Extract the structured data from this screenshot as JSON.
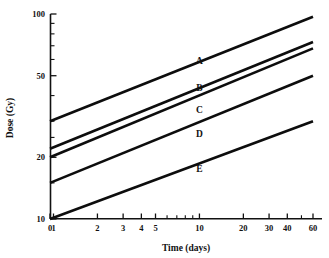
{
  "chart_data": {
    "type": "line",
    "title": "",
    "xlabel": "Time  (days)",
    "ylabel": "Dose  (Gy)",
    "xscale": "log",
    "yscale": "log",
    "xlim": [
      0,
      65
    ],
    "ylim": [
      10,
      100
    ],
    "grid": false,
    "legend_position": "inline-right",
    "x_tick_labels": [
      "0",
      "1",
      "2",
      "3",
      "4",
      "5",
      "10",
      "20",
      "30",
      "40",
      "60"
    ],
    "x_tick_values": [
      0,
      1,
      2,
      3,
      4,
      5,
      10,
      20,
      30,
      40,
      60
    ],
    "x_minor_ticks": [
      6,
      7,
      8,
      9,
      50
    ],
    "y_tick_labels": [
      "10",
      "20",
      "50",
      "100"
    ],
    "y_tick_values": [
      10,
      20,
      50,
      100
    ],
    "y_minor_ticks": [
      15,
      25,
      30,
      40,
      60,
      70,
      80,
      90
    ],
    "series": [
      {
        "name": "A",
        "label": "A",
        "x": [
          0,
          60
        ],
        "values": [
          30,
          97
        ],
        "label_x": 10,
        "label_y": 57
      },
      {
        "name": "B",
        "label": "B",
        "x": [
          0,
          60
        ],
        "values": [
          22,
          73
        ],
        "label_x": 10,
        "label_y": 42
      },
      {
        "name": "C",
        "label": "C",
        "x": [
          0,
          60
        ],
        "values": [
          20,
          68
        ],
        "label_x": 10,
        "label_y": 33
      },
      {
        "name": "D",
        "label": "D",
        "x": [
          0,
          60
        ],
        "values": [
          15,
          50
        ],
        "label_x": 10,
        "label_y": 25
      },
      {
        "name": "E",
        "label": "E",
        "x": [
          0,
          60
        ],
        "values": [
          10,
          30
        ],
        "label_x": 10,
        "label_y": 17
      }
    ]
  },
  "colors": {
    "line": "#0d0d0d",
    "axis": "#111111",
    "background": "#ffffff"
  }
}
